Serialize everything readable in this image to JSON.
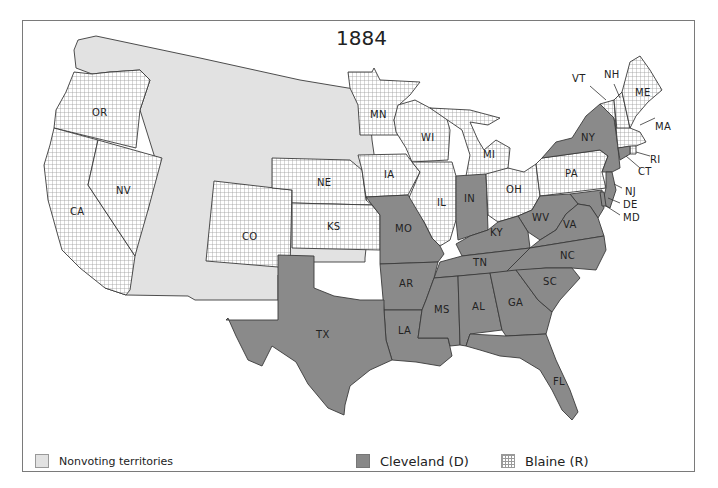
{
  "map": {
    "title": "1884",
    "colors": {
      "nonvoting": "#e2e2e2",
      "cleveland": "#8a8a8a",
      "blaine_pattern": "crosshatch",
      "border": "#3a3a3a",
      "water": "#ffffff"
    },
    "legend": {
      "nonvoting": "Nonvoting territories",
      "cleveland": "Cleveland (D)",
      "blaine": "Blaine (R)"
    },
    "states": {
      "cleveland": [
        "NY",
        "NJ",
        "CT",
        "DE",
        "MD",
        "WV",
        "VA",
        "NC",
        "SC",
        "GA",
        "FL",
        "AL",
        "MS",
        "TN",
        "KY",
        "LA",
        "AR",
        "MO",
        "TX",
        "IN"
      ],
      "blaine": [
        "OR",
        "CA",
        "NV",
        "CO",
        "NE",
        "KS",
        "MN",
        "IA",
        "WI",
        "IL",
        "MI",
        "OH",
        "PA",
        "VT",
        "NH",
        "ME",
        "MA",
        "RI"
      ],
      "nonvoting": [
        "Washington Territory",
        "Idaho",
        "Montana",
        "Dakota",
        "Wyoming",
        "Utah",
        "Arizona",
        "New Mexico",
        "Indian Territory"
      ]
    },
    "labels": {
      "OR": "OR",
      "CA": "CA",
      "NV": "NV",
      "CO": "CO",
      "NE": "NE",
      "KS": "KS",
      "MN": "MN",
      "IA": "IA",
      "WI": "WI",
      "IL": "IL",
      "MI": "MI",
      "IN": "IN",
      "OH": "OH",
      "PA": "PA",
      "NY": "NY",
      "VT": "VT",
      "NH": "NH",
      "ME": "ME",
      "MA": "MA",
      "RI": "RI",
      "CT": "CT",
      "NJ": "NJ",
      "DE": "DE",
      "MD": "MD",
      "WV": "WV",
      "VA": "VA",
      "KY": "KY",
      "MO": "MO",
      "TN": "TN",
      "NC": "NC",
      "SC": "SC",
      "AR": "AR",
      "MS": "MS",
      "AL": "AL",
      "GA": "GA",
      "LA": "LA",
      "TX": "TX",
      "FL": "FL"
    }
  }
}
